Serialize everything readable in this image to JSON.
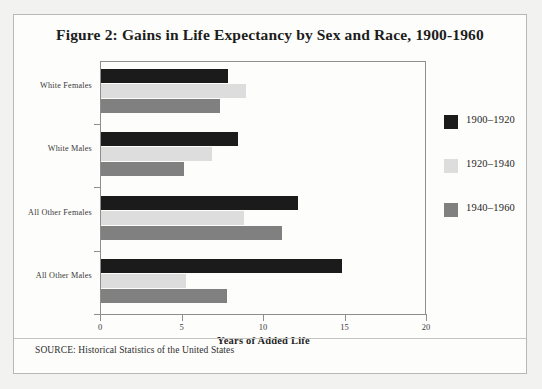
{
  "figure": {
    "title": "Figure 2: Gains in Life Expectancy by Sex and Race, 1900-1960",
    "source_note": "SOURCE: Historical Statistics of the United States"
  },
  "chart_data": {
    "type": "bar",
    "orientation": "horizontal",
    "title": "Figure 2: Gains in Life Expectancy by Sex and Race, 1900-1960",
    "categories": [
      "White Females",
      "White Males",
      "All Other Females",
      "All Other Males"
    ],
    "series": [
      {
        "name": "1900–1920",
        "color": "#1b1b1b",
        "values": [
          7.8,
          8.4,
          12.1,
          14.8
        ]
      },
      {
        "name": "1920–1940",
        "color": "#dddddd",
        "values": [
          8.9,
          6.8,
          8.8,
          5.2
        ]
      },
      {
        "name": "1940–1960",
        "color": "#808080",
        "values": [
          7.3,
          5.1,
          11.1,
          7.7
        ]
      }
    ],
    "xlabel": "Years of Added Life",
    "ylabel": "",
    "xlim": [
      0,
      20
    ],
    "xticks": [
      0,
      5,
      10,
      15,
      20
    ],
    "xtick_labels": [
      "0",
      "5",
      "10",
      "15",
      "20"
    ],
    "grid": false,
    "legend_position": "right"
  }
}
